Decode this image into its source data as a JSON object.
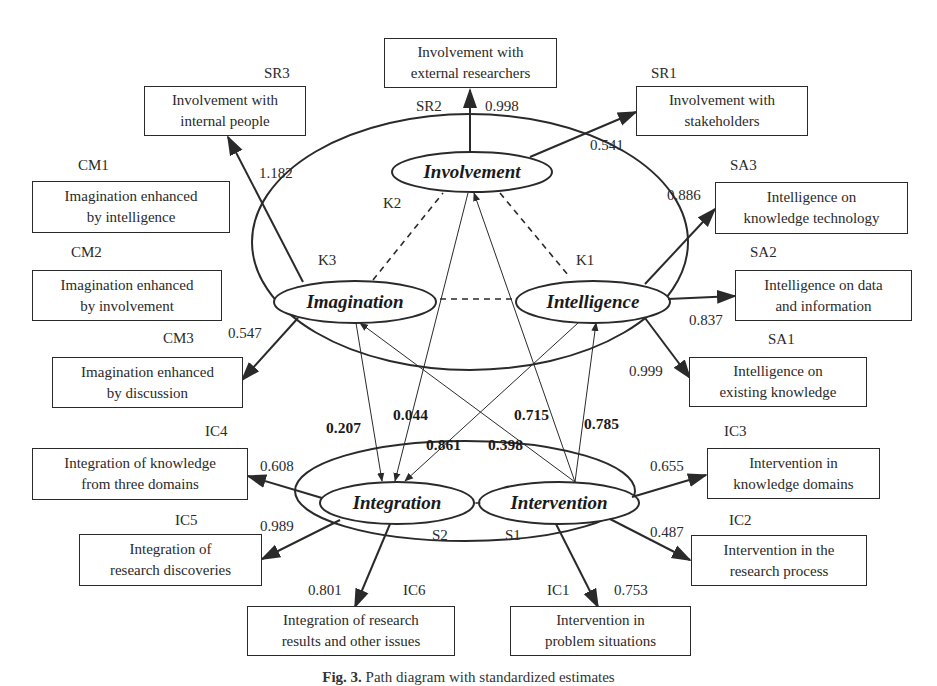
{
  "figure": {
    "caption_label": "Fig. 3.",
    "caption_text": "Path diagram with standardized estimates"
  },
  "latent_constructs": {
    "involvement": "Involvement",
    "imagination": "Imagination",
    "intelligence": "Intelligence",
    "integration": "Integration",
    "intervention": "Intervention"
  },
  "group_labels": {
    "k1": "K1",
    "k2": "K2",
    "k3": "K3",
    "s1": "S1",
    "s2": "S2"
  },
  "indicators": {
    "sr1": {
      "code": "SR1",
      "line1": "Involvement with",
      "line2": "stakeholders",
      "loading": "0.541"
    },
    "sr2": {
      "code": "SR2",
      "line1": "Involvement with",
      "line2": "external researchers",
      "loading": "0.998"
    },
    "sr3": {
      "code": "SR3",
      "line1": "Involvement with",
      "line2": "internal people",
      "loading": "1.182"
    },
    "cm1": {
      "code": "CM1",
      "line1": "Imagination enhanced",
      "line2": "by intelligence"
    },
    "cm2": {
      "code": "CM2",
      "line1": "Imagination enhanced",
      "line2": "by involvement"
    },
    "cm3": {
      "code": "CM3",
      "line1": "Imagination enhanced",
      "line2": "by discussion",
      "loading": "0.547"
    },
    "sa1": {
      "code": "SA1",
      "line1": "Intelligence on",
      "line2": "existing knowledge",
      "loading": "0.999"
    },
    "sa2": {
      "code": "SA2",
      "line1": "Intelligence on data",
      "line2": "and information",
      "loading": "0.837"
    },
    "sa3": {
      "code": "SA3",
      "line1": "Intelligence on",
      "line2": "knowledge technology",
      "loading": "0.886"
    },
    "ic1": {
      "code": "IC1",
      "line1": "Intervention in",
      "line2": "problem situations",
      "loading": "0.753"
    },
    "ic2": {
      "code": "IC2",
      "line1": "Intervention in the",
      "line2": "research process",
      "loading": "0.487"
    },
    "ic3": {
      "code": "IC3",
      "line1": "Intervention in",
      "line2": "knowledge domains",
      "loading": "0.655"
    },
    "ic4": {
      "code": "IC4",
      "line1": "Integration of knowledge",
      "line2": "from three domains",
      "loading": "0.608"
    },
    "ic5": {
      "code": "IC5",
      "line1": "Integration of",
      "line2": "research discoveries",
      "loading": "0.989"
    },
    "ic6": {
      "code": "IC6",
      "line1": "Integration of research",
      "line2": "results and other issues",
      "loading": "0.801"
    }
  },
  "structural_paths": [
    {
      "from": "Imagination",
      "to": "Integration",
      "estimate": "0.207"
    },
    {
      "from": "Involvement",
      "to": "Integration",
      "estimate": "0.044"
    },
    {
      "from": "Intelligence",
      "to": "Integration",
      "estimate": "0.861"
    },
    {
      "from": "Intervention",
      "to": "Imagination",
      "estimate": "0.398"
    },
    {
      "from": "Intervention",
      "to": "Involvement",
      "estimate": "0.715"
    },
    {
      "from": "Intervention",
      "to": "Intelligence",
      "estimate": "0.785"
    }
  ],
  "colors": {
    "stroke": "#2a2a2a",
    "background": "#ffffff"
  }
}
